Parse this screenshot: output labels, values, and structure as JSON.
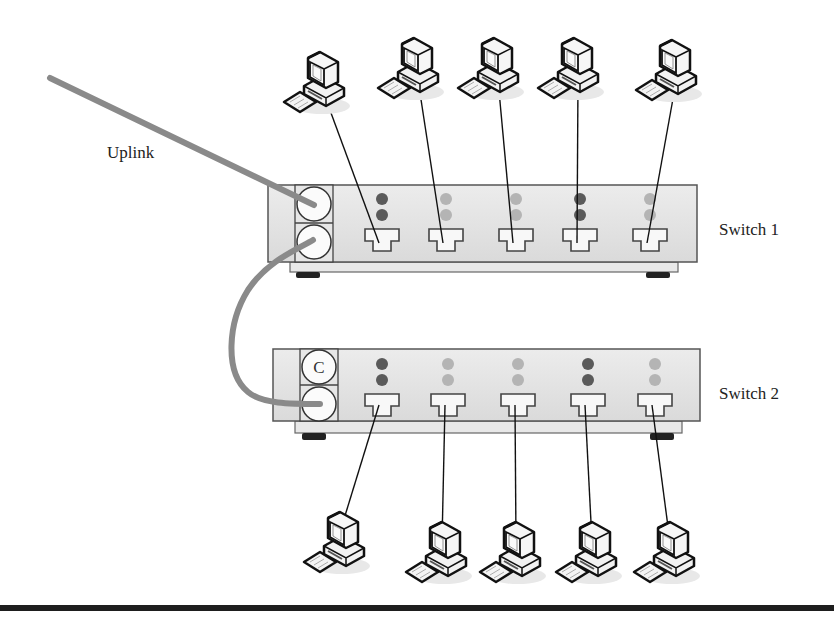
{
  "labels": {
    "uplink": "Uplink",
    "switch1": "Switch 1",
    "switch2": "Switch 2",
    "uplink_port_letter": "C"
  },
  "colors": {
    "cable": "#8a8a8a",
    "switch_body": "#e4e4e4",
    "switch_border": "#555555",
    "led_dark": "#5a5a5a",
    "led_light": "#b4b4b4",
    "foot": "#222222",
    "rule": "#1e1e1e"
  },
  "switch1": {
    "name": "Switch 1",
    "box": {
      "x": 268,
      "y": 185,
      "w": 429,
      "h": 77
    },
    "ports_x": [
      382,
      446,
      516,
      580,
      650
    ],
    "led_state": [
      "dark",
      "light",
      "light",
      "dark",
      "light"
    ],
    "computers": [
      {
        "x": 318,
        "y": 80,
        "port": 0
      },
      {
        "x": 412,
        "y": 66,
        "port": 1
      },
      {
        "x": 492,
        "y": 66,
        "port": 2
      },
      {
        "x": 572,
        "y": 66,
        "port": 3
      },
      {
        "x": 670,
        "y": 68,
        "port": 4
      }
    ]
  },
  "switch2": {
    "name": "Switch 2",
    "box": {
      "x": 273,
      "y": 349,
      "w": 427,
      "h": 72
    },
    "ports_x": [
      382,
      448,
      518,
      588,
      655
    ],
    "led_state": [
      "dark",
      "light",
      "light",
      "dark",
      "light"
    ],
    "computers": [
      {
        "x": 338,
        "y": 540,
        "port": 0
      },
      {
        "x": 440,
        "y": 550,
        "port": 1
      },
      {
        "x": 514,
        "y": 550,
        "port": 2
      },
      {
        "x": 590,
        "y": 550,
        "port": 3
      },
      {
        "x": 668,
        "y": 550,
        "port": 4
      }
    ]
  }
}
